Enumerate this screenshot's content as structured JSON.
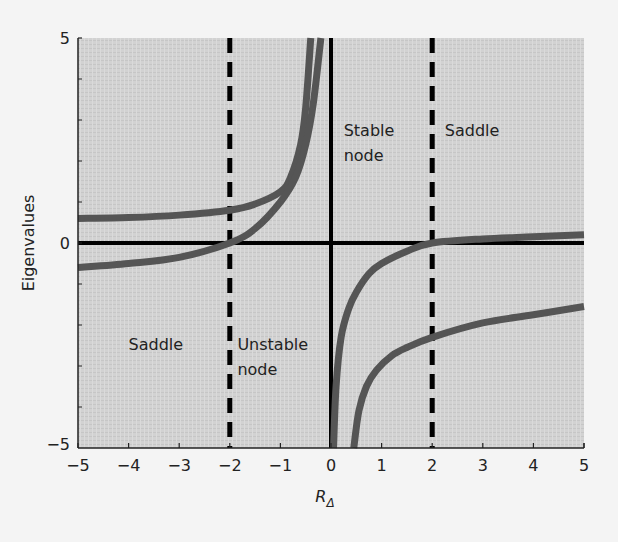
{
  "chart_data": {
    "type": "line",
    "title": "",
    "xlabel": "R_Δ",
    "xlabel_main": "R",
    "xlabel_sub": "Δ",
    "ylabel": "Eigenvalues",
    "xlim": [
      -5,
      5
    ],
    "ylim": [
      -5,
      5
    ],
    "xticks": [
      -5,
      -4,
      -3,
      -2,
      -1,
      0,
      1,
      2,
      3,
      4,
      5
    ],
    "xtick_labels": [
      "−5",
      "−4",
      "−3",
      "−2",
      "−1",
      "0",
      "1",
      "2",
      "3",
      "4",
      "5"
    ],
    "yticks": [
      -5,
      0,
      5
    ],
    "ytick_labels": [
      "−5",
      "0",
      "5"
    ],
    "grid": false,
    "background": "#cfcfcf",
    "curve_color": "#555555",
    "reference_lines": [
      {
        "type": "vertical",
        "x": -2,
        "style": "dashed"
      },
      {
        "type": "vertical",
        "x": 2,
        "style": "dashed"
      },
      {
        "type": "vertical",
        "x": 0,
        "style": "solid"
      },
      {
        "type": "horizontal",
        "y": 0,
        "style": "solid"
      }
    ],
    "series": [
      {
        "name": "eigenvalue-1-left",
        "x": [
          -5,
          -4,
          -3,
          -2,
          -1.5,
          -1,
          -0.8,
          -0.6,
          -0.5,
          -0.4
        ],
        "y": [
          0.6,
          0.62,
          0.68,
          0.8,
          0.95,
          1.25,
          1.6,
          2.4,
          3.3,
          5
        ]
      },
      {
        "name": "eigenvalue-2-left",
        "x": [
          -5,
          -4,
          -3,
          -2,
          -1.5,
          -1,
          -0.7,
          -0.5,
          -0.35,
          -0.2
        ],
        "y": [
          -0.6,
          -0.5,
          -0.35,
          0,
          0.35,
          1.0,
          1.6,
          2.4,
          3.4,
          5
        ]
      },
      {
        "name": "eigenvalue-1-right",
        "x": [
          0.05,
          0.1,
          0.2,
          0.35,
          0.5,
          0.75,
          1,
          1.5,
          2,
          3,
          4,
          5
        ],
        "y": [
          -5,
          -3.5,
          -2.3,
          -1.6,
          -1.2,
          -0.75,
          -0.5,
          -0.2,
          0,
          0.1,
          0.15,
          0.2
        ]
      },
      {
        "name": "eigenvalue-2-right",
        "x": [
          0.45,
          0.55,
          0.7,
          0.9,
          1.2,
          1.5,
          2,
          3,
          4,
          5
        ],
        "y": [
          -5,
          -4.1,
          -3.5,
          -3.1,
          -2.75,
          -2.55,
          -2.3,
          -1.95,
          -1.75,
          -1.55
        ]
      }
    ],
    "annotations": [
      {
        "text": [
          "Saddle"
        ],
        "x": -4.0,
        "y": -2.6
      },
      {
        "text": [
          "Unstable",
          "node"
        ],
        "x": -1.85,
        "y": -2.6
      },
      {
        "text": [
          "Stable",
          "node"
        ],
        "x": 0.25,
        "y": 2.6
      },
      {
        "text": [
          "Saddle"
        ],
        "x": 2.25,
        "y": 2.6
      }
    ]
  }
}
